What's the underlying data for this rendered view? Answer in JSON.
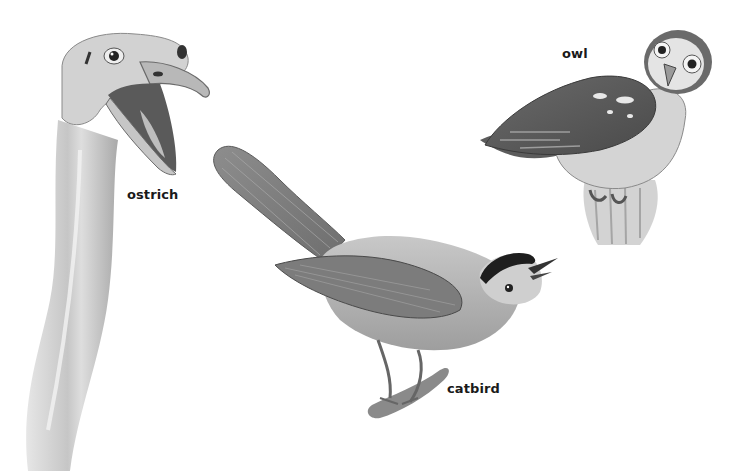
{
  "image": {
    "description": "Grayscale pencil illustrations of three birds with labels",
    "background": "#ffffff"
  },
  "birds": [
    {
      "id": "ostrich",
      "label": "ostrich"
    },
    {
      "id": "owl",
      "label": "owl"
    },
    {
      "id": "catbird",
      "label": "catbird"
    }
  ],
  "colors": {
    "ink": "#1a1a1a",
    "dark_gray": "#555555",
    "mid_gray": "#8a8a8a",
    "light_gray": "#bdbdbd",
    "pale_gray": "#dedede"
  }
}
